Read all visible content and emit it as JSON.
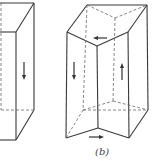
{
  "figure": {
    "label": "(b)",
    "left_prism": {
      "arrows": [
        {
          "direction": "down"
        }
      ]
    },
    "right_prism": {
      "arrows": [
        {
          "position": "top-face",
          "direction": "left"
        },
        {
          "position": "front-left-face",
          "direction": "down"
        },
        {
          "position": "front-right-face",
          "direction": "up"
        },
        {
          "position": "bottom-face",
          "direction": "right"
        }
      ]
    }
  }
}
